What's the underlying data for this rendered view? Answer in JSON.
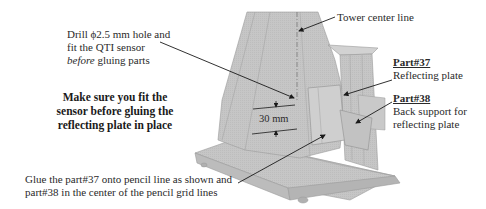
{
  "diagram": {
    "colors": {
      "model_fill": "#c4c4c4",
      "model_dark": "#a9a9a9",
      "model_light": "#d6d6d6",
      "edge": "#8a8a8a",
      "leader": "#1a1a1a",
      "text": "#2a2a2a"
    },
    "annotations": {
      "drill": {
        "line1": "Drill ϕ2.5 mm hole and",
        "line2": "fit the QTI sensor",
        "line3_italic": "before",
        "line3_rest": " gluing parts"
      },
      "warning": {
        "line1": "Make sure you fit the",
        "line2": "sensor before gluing the",
        "line3": "reflecting plate in place"
      },
      "glue": {
        "line1": "Glue the part#37 onto pencil line as shown and",
        "line2": "part#38 in the center of the pencil grid lines"
      },
      "tower_center": "Tower center line",
      "part37": {
        "title": "Part#37",
        "desc": "Reflecting plate"
      },
      "part38": {
        "title": "Part#38",
        "desc_line1": "Back support for",
        "desc_line2": "reflecting plate"
      },
      "dimension": "30 mm"
    }
  }
}
